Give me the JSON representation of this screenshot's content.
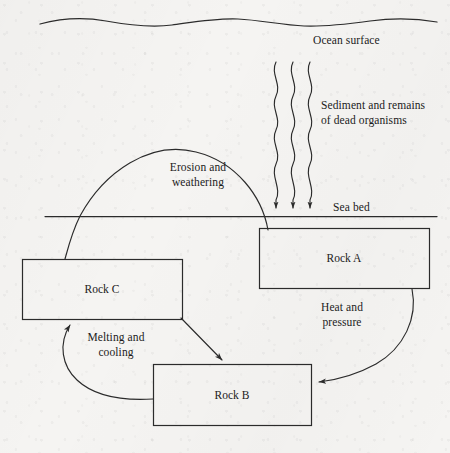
{
  "diagram": {
    "canvas": {
      "width": 450,
      "height": 453
    },
    "colors": {
      "background": "#f5f4f2",
      "ink": "#1b1b1b",
      "line": "#2b2b2b"
    },
    "labels": {
      "ocean_surface": "Ocean surface",
      "sediment": "Sediment and remains\nof dead organisms",
      "erosion": "Erosion and\nweathering",
      "sea_bed": "Sea bed",
      "heat_pressure": "Heat and\npressure",
      "melting_cooling": "Melting and\ncooling"
    },
    "boxes": [
      {
        "id": "rock-a",
        "label": "Rock A",
        "x": 259,
        "y": 228,
        "w": 170,
        "h": 60
      },
      {
        "id": "rock-c",
        "label": "Rock C",
        "x": 22,
        "y": 259,
        "w": 160,
        "h": 60
      },
      {
        "id": "rock-b",
        "label": "Rock B",
        "x": 153,
        "y": 364,
        "w": 158,
        "h": 61
      }
    ],
    "connections": [
      {
        "id": "sediment-fall",
        "from": "ocean",
        "to": "rock-a",
        "style": "wavy-arrow",
        "count": 3,
        "label": "Sediment and remains of dead organisms"
      },
      {
        "id": "erosion-arc",
        "from": "rock-a",
        "to": "rock-c",
        "style": "arc",
        "label": "Erosion and weathering"
      },
      {
        "id": "heat-pressure-arc",
        "from": "rock-a",
        "to": "rock-b",
        "style": "arc-arrow",
        "label": "Heat and pressure"
      },
      {
        "id": "rock-c-to-rock-b",
        "from": "rock-c",
        "to": "rock-b",
        "style": "straight-arrow",
        "label": ""
      },
      {
        "id": "melting-arc",
        "from": "rock-b",
        "to": "rock-c",
        "style": "arc-arrow",
        "label": "Melting and cooling"
      }
    ],
    "features": [
      {
        "id": "ocean-surface-wave",
        "type": "wavy-line"
      },
      {
        "id": "sea-bed-line",
        "type": "straight-line"
      }
    ]
  }
}
